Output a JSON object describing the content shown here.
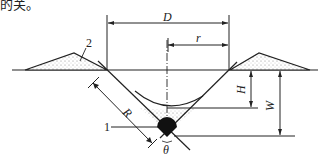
{
  "top_text": "的关。",
  "labels": {
    "D": "D",
    "r": "r",
    "H": "H",
    "W": "W",
    "R": "R",
    "theta": "θ",
    "callout_1": "1",
    "callout_2": "2"
  },
  "colors": {
    "line": "#222222",
    "ball": "#111111",
    "soil_fill": "#d9d9d9"
  }
}
